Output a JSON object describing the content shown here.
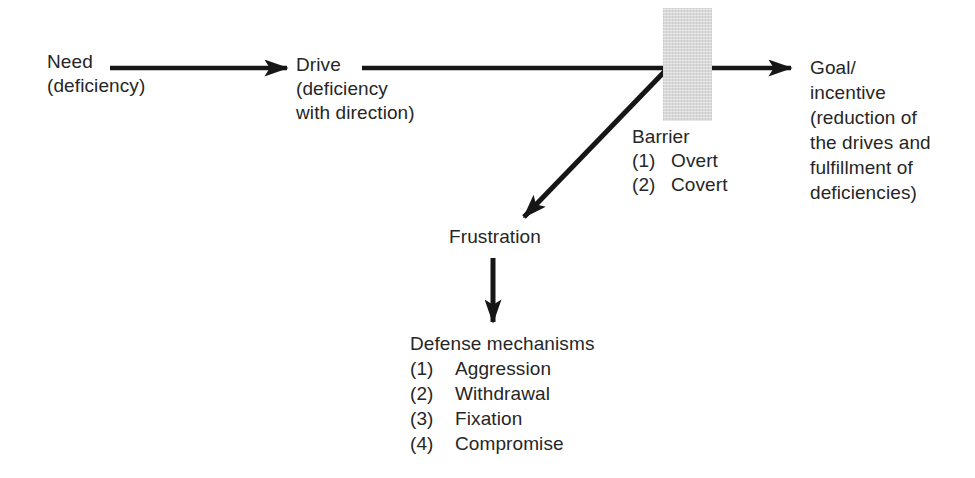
{
  "figure": {
    "colors": {
      "background": "#ffffff",
      "text": "#262626",
      "arrow": "#161616",
      "barrier_fill": "#d9d9d9"
    },
    "nodes": {
      "need": {
        "title": "Need",
        "lines": [
          "(deficiency)"
        ]
      },
      "drive": {
        "title": "Drive",
        "lines": [
          "(deficiency",
          "with direction)"
        ]
      },
      "barrier": {
        "title": "Barrier",
        "items": [
          {
            "num": "(1)",
            "label": "Overt"
          },
          {
            "num": "(2)",
            "label": "Covert"
          }
        ]
      },
      "goal": {
        "lines": [
          "Goal/",
          "incentive",
          "(reduction of",
          "the drives and",
          "fulfillment of",
          "deficiencies)"
        ]
      },
      "frustration": {
        "title": "Frustration"
      },
      "defense": {
        "title": "Defense mechanisms",
        "items": [
          {
            "num": "(1)",
            "label": "Aggression"
          },
          {
            "num": "(2)",
            "label": "Withdrawal"
          },
          {
            "num": "(3)",
            "label": "Fixation"
          },
          {
            "num": "(4)",
            "label": "Compromise"
          }
        ]
      }
    }
  }
}
